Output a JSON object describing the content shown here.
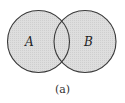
{
  "diagram": {
    "type": "venn",
    "caption": "(a)",
    "sets": [
      {
        "id": "A",
        "label": "A",
        "shaded": true
      },
      {
        "id": "B",
        "label": "B",
        "shaded": true
      }
    ],
    "shaded_region": "A ∪ B",
    "colors": {
      "fill": "#d9d9d9",
      "stroke": "#3a3a3a",
      "background": "#ffffff"
    }
  }
}
